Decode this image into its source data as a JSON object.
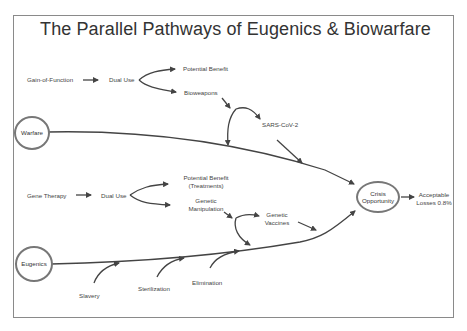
{
  "title": "The Parallel Pathways of Eugenics & Biowarfare",
  "nodes": {
    "warfare": "Warfare",
    "eugenics": "Eugenics",
    "crisis_line1": "Crisis",
    "crisis_line2": "Opportunity"
  },
  "upper_branch": {
    "start": "Gain-of-Function",
    "mid": "Dual Use",
    "benefit": "Potential Benefit",
    "harm": "Bioweapons",
    "result": "SARS-CoV-2"
  },
  "lower_branch": {
    "start": "Gene Therapy",
    "mid": "Dual Use",
    "benefit_line1": "Potential Benefit",
    "benefit_line2": "(Treatments)",
    "harm_line1": "Genetic",
    "harm_line2": "Manipulation",
    "result_line1": "Genetic",
    "result_line2": "Vaccines"
  },
  "eugenics_inputs": [
    "Slavery",
    "Sterilization",
    "Elimination"
  ],
  "outcome": {
    "line1": "Acceptable",
    "line2": "Losses 0.8%"
  },
  "colors": {
    "line": "#444444",
    "circle": "#777777",
    "frame": "#8a8a8a"
  }
}
